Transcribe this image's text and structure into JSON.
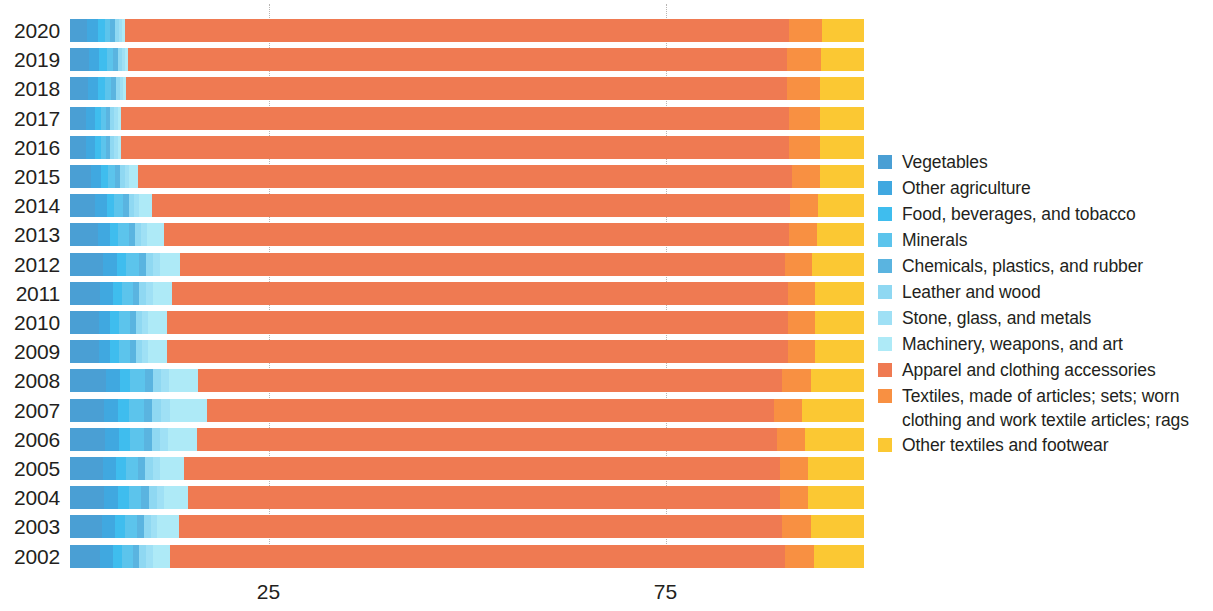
{
  "chart_data": {
    "type": "bar",
    "orientation": "horizontal",
    "stacked": true,
    "normalized_percent": true,
    "title": "",
    "subtitle": "",
    "xlabel": "",
    "ylabel": "",
    "xlim": [
      0,
      100
    ],
    "xticks": [
      25,
      75
    ],
    "xtick_labels": [
      "25",
      "75"
    ],
    "grid": "vertical-dotted",
    "legend_position": "right",
    "categories": [
      "2020",
      "2019",
      "2018",
      "2017",
      "2016",
      "2015",
      "2014",
      "2013",
      "2012",
      "2011",
      "2010",
      "2009",
      "2008",
      "2007",
      "2006",
      "2005",
      "2004",
      "2003",
      "2002"
    ],
    "series": [
      {
        "name": "Vegetables",
        "color": "#4a9fd4",
        "values": [
          2.2,
          2.4,
          2.3,
          2.0,
          2.0,
          2.6,
          3.2,
          3.5,
          4.2,
          3.8,
          3.6,
          3.6,
          4.5,
          4.3,
          4.4,
          4.1,
          4.3,
          4.0,
          3.8
        ]
      },
      {
        "name": "Other agriculture",
        "color": "#40a8e0",
        "values": [
          1.3,
          1.3,
          1.2,
          1.1,
          1.1,
          1.3,
          1.4,
          1.5,
          1.7,
          1.6,
          1.5,
          1.5,
          1.8,
          1.8,
          1.8,
          1.7,
          1.8,
          1.7,
          1.6
        ]
      },
      {
        "name": "Food, beverages, and tobacco",
        "color": "#3fbdee",
        "values": [
          0.9,
          0.9,
          0.9,
          0.8,
          0.8,
          0.9,
          1.0,
          1.1,
          1.2,
          1.1,
          1.1,
          1.1,
          1.3,
          1.3,
          1.3,
          1.2,
          1.3,
          1.2,
          1.1
        ]
      },
      {
        "name": "Minerals",
        "color": "#5cc4ec",
        "values": [
          0.7,
          0.8,
          0.8,
          0.7,
          0.7,
          0.9,
          1.1,
          1.3,
          1.6,
          1.4,
          1.3,
          1.3,
          1.8,
          1.9,
          1.8,
          1.6,
          1.6,
          1.5,
          1.4
        ]
      },
      {
        "name": "Chemicals, plastics, and rubber",
        "color": "#5ab4e0",
        "values": [
          0.6,
          0.6,
          0.6,
          0.5,
          0.5,
          0.6,
          0.7,
          0.8,
          0.9,
          0.8,
          0.8,
          0.8,
          1.0,
          1.0,
          1.0,
          0.9,
          0.9,
          0.9,
          0.8
        ]
      },
      {
        "name": "Leather and wood",
        "color": "#8fd8f2",
        "values": [
          0.5,
          0.5,
          0.5,
          0.5,
          0.5,
          0.6,
          0.7,
          0.8,
          0.9,
          0.9,
          0.8,
          0.8,
          1.1,
          1.2,
          1.1,
          1.0,
          1.0,
          0.9,
          0.9
        ]
      },
      {
        "name": "Stone, glass, and metals",
        "color": "#9fe0f5",
        "values": [
          0.4,
          0.4,
          0.4,
          0.4,
          0.4,
          0.5,
          0.6,
          0.7,
          0.8,
          0.8,
          0.7,
          0.7,
          1.0,
          1.1,
          1.0,
          0.9,
          0.9,
          0.8,
          0.8
        ]
      },
      {
        "name": "Machinery, weapons, and art",
        "color": "#aeeaf7",
        "values": [
          0.3,
          0.4,
          0.4,
          0.4,
          0.4,
          1.2,
          1.6,
          2.1,
          2.6,
          2.5,
          2.4,
          2.4,
          3.6,
          4.6,
          3.6,
          3.0,
          3.1,
          2.7,
          2.2
        ]
      },
      {
        "name": "Apparel and clothing accessories",
        "color": "#ef7a52",
        "values": [
          83.6,
          83.0,
          83.2,
          84.2,
          84.2,
          82.3,
          80.4,
          78.8,
          76.1,
          77.5,
          78.3,
          78.3,
          73.6,
          71.5,
          73.0,
          75.0,
          74.5,
          76.0,
          77.5
        ]
      },
      {
        "name": "Textiles, made of articles; sets; worn clothing and work textile articles; rags",
        "color": "#f89042",
        "values": [
          4.2,
          4.3,
          4.2,
          3.9,
          3.9,
          3.6,
          3.5,
          3.5,
          3.5,
          3.4,
          3.4,
          3.4,
          3.6,
          3.5,
          3.6,
          3.6,
          3.6,
          3.6,
          3.6
        ]
      },
      {
        "name": "Other textiles and footwear",
        "color": "#fbc833",
        "values": [
          5.3,
          5.4,
          5.5,
          5.5,
          5.5,
          5.5,
          5.8,
          5.9,
          6.5,
          6.2,
          6.1,
          6.1,
          6.7,
          7.8,
          7.4,
          7.0,
          7.0,
          6.7,
          6.3
        ]
      }
    ]
  },
  "legend": {
    "items": [
      {
        "label": "Vegetables",
        "color": "#4a9fd4"
      },
      {
        "label": "Other agriculture",
        "color": "#40a8e0"
      },
      {
        "label": "Food, beverages, and tobacco",
        "color": "#3fbdee"
      },
      {
        "label": "Minerals",
        "color": "#5cc4ec"
      },
      {
        "label": "Chemicals, plastics, and rubber",
        "color": "#5ab4e0"
      },
      {
        "label": "Leather and wood",
        "color": "#8fd8f2"
      },
      {
        "label": "Stone, glass, and metals",
        "color": "#9fe0f5"
      },
      {
        "label": "Machinery, weapons, and art",
        "color": "#aeeaf7"
      },
      {
        "label": "Apparel and clothing accessories",
        "color": "#ef7a52"
      },
      {
        "label": "Textiles, made of articles; sets; worn clothing and work textile articles; rags",
        "color": "#f89042"
      },
      {
        "label": "Other textiles and footwear",
        "color": "#fbc833"
      }
    ]
  }
}
